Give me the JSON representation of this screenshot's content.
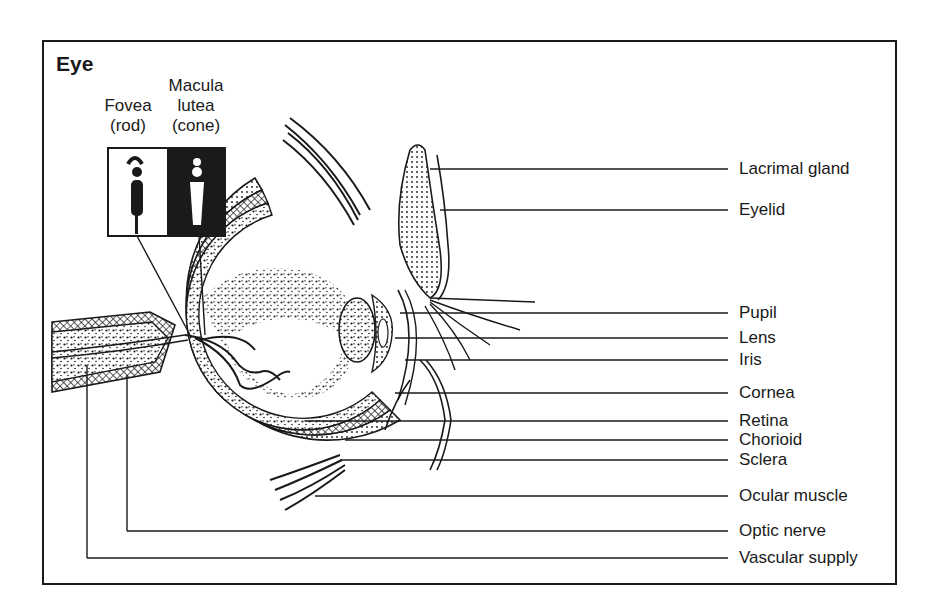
{
  "figure": {
    "title": "Eye",
    "inset": {
      "left_caption": [
        "Fovea",
        "(rod)"
      ],
      "right_caption": [
        "Macula",
        "lutea",
        "(cone)"
      ]
    },
    "labels": [
      {
        "text": "Lacrimal gland",
        "y": 169,
        "x_start": 430
      },
      {
        "text": "Eyelid",
        "y": 210,
        "x_start": 440
      },
      {
        "text": "Pupil",
        "y": 313,
        "x_start": 400
      },
      {
        "text": "Lens",
        "y": 338,
        "x_start": 395
      },
      {
        "text": "Iris",
        "y": 360,
        "x_start": 405
      },
      {
        "text": "Cornea",
        "y": 393,
        "x_start": 395
      },
      {
        "text": "Retina",
        "y": 421,
        "x_start": 305
      },
      {
        "text": "Chorioid",
        "y": 440,
        "x_start": 345
      },
      {
        "text": "Sclera",
        "y": 460,
        "x_start": 340
      },
      {
        "text": "Ocular muscle",
        "y": 496,
        "x_start": 315
      },
      {
        "text": "Optic nerve",
        "y": 531,
        "x_start": 127
      },
      {
        "text": "Vascular supply",
        "y": 558,
        "x_start": 87
      }
    ],
    "colors": {
      "ink": "#1a1a1a",
      "paper": "#ffffff"
    }
  }
}
